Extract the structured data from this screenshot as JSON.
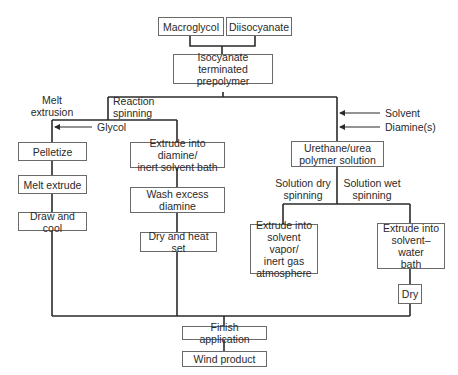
{
  "diagram": {
    "type": "flowchart",
    "nodes": {
      "macroglycol": "Macroglycol",
      "diisocyanate": "Diisocyanate",
      "prepolymer": "Isocyanate terminated\nprepolymer",
      "pelletize": "Pelletize",
      "melt_extrude": "Melt extrude",
      "draw_cool": "Draw and cool",
      "extrude_diamine": "Extrude into diamine/\ninert solvent bath",
      "wash": "Wash excess\ndiamine",
      "dry_heat": "Dry and heat set",
      "urethane_solution": "Urethane/urea\npolymer solution",
      "extrude_vapor": "Extrude into\nsolvent vapor/\ninert gas\natmosphere",
      "extrude_water": "Extrude into\nsolvent–water\nbath",
      "dry": "Dry",
      "finish": "Finish application",
      "wind": "Wind product"
    },
    "branch_labels": {
      "melt_extrusion": "Melt\nextrusion",
      "reaction_spinning": "Reaction\nspinning",
      "solution_dry": "Solution dry\nspinning",
      "solution_wet": "Solution wet\nspinning"
    },
    "inputs": {
      "glycol": "Glycol",
      "solvent": "Solvent",
      "diamines": "Diamine(s)"
    },
    "edges": [
      [
        "macroglycol",
        "prepolymer"
      ],
      [
        "diisocyanate",
        "prepolymer"
      ],
      [
        "prepolymer",
        "pelletize"
      ],
      [
        "prepolymer",
        "extrude_diamine"
      ],
      [
        "prepolymer",
        "urethane_solution"
      ],
      [
        "pelletize",
        "melt_extrude"
      ],
      [
        "melt_extrude",
        "draw_cool"
      ],
      [
        "extrude_diamine",
        "wash"
      ],
      [
        "wash",
        "dry_heat"
      ],
      [
        "urethane_solution",
        "extrude_vapor"
      ],
      [
        "urethane_solution",
        "extrude_water"
      ],
      [
        "extrude_water",
        "dry"
      ],
      [
        "draw_cool",
        "finish"
      ],
      [
        "dry_heat",
        "finish"
      ],
      [
        "extrude_vapor",
        "finish"
      ],
      [
        "dry",
        "finish"
      ],
      [
        "finish",
        "wind"
      ]
    ]
  }
}
